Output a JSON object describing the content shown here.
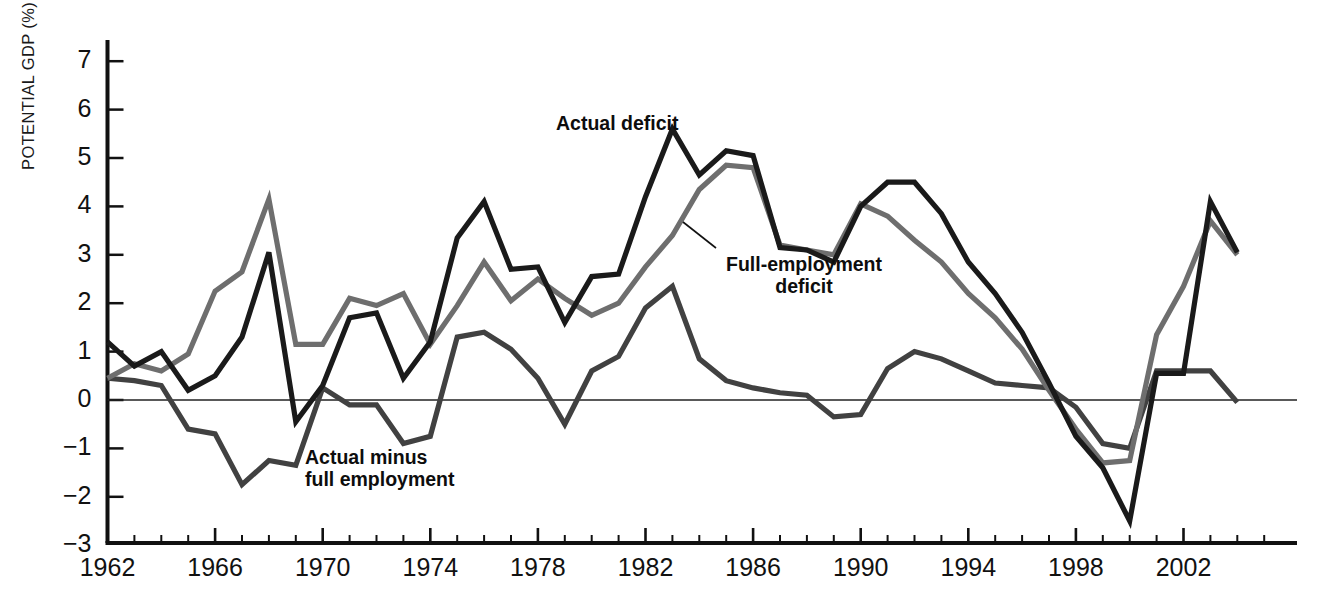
{
  "chart_data": {
    "type": "line",
    "title": "",
    "subtitle": "",
    "xlabel": "",
    "ylabel": "POTENTIAL GDP (%)",
    "xlim": [
      1962,
      2005
    ],
    "ylim": [
      -3,
      7
    ],
    "yticks": [
      7,
      6,
      5,
      4,
      3,
      2,
      1,
      0,
      -1,
      -2,
      -3
    ],
    "ytick_labels": [
      "7",
      "6",
      "5",
      "4",
      "3",
      "2",
      "1",
      "0",
      "−1",
      "−2",
      "−3"
    ],
    "xticks": [
      1962,
      1966,
      1970,
      1974,
      1978,
      1982,
      1986,
      1990,
      1994,
      1998,
      2002
    ],
    "xtick_labels": [
      "1962",
      "1966",
      "1970",
      "1974",
      "1978",
      "1982",
      "1986",
      "1990",
      "1994",
      "1998",
      "2002"
    ],
    "minor_xtick_step": 1,
    "grid": false,
    "zero_line": true,
    "legend_position": "inline-annotations",
    "x": [
      1962,
      1963,
      1964,
      1965,
      1966,
      1967,
      1968,
      1969,
      1970,
      1971,
      1972,
      1973,
      1974,
      1975,
      1976,
      1977,
      1978,
      1979,
      1980,
      1981,
      1982,
      1983,
      1984,
      1985,
      1986,
      1987,
      1988,
      1989,
      1990,
      1991,
      1992,
      1993,
      1994,
      1995,
      1996,
      1997,
      1998,
      1999,
      2000,
      2001,
      2002,
      2003,
      2004
    ],
    "series": [
      {
        "name": "Actual deficit",
        "color": "#1a1a1a",
        "values": [
          1.2,
          0.7,
          1.0,
          0.2,
          0.5,
          1.3,
          3.05,
          -0.45,
          0.3,
          1.7,
          1.8,
          0.45,
          1.2,
          3.35,
          4.1,
          2.7,
          2.75,
          1.6,
          2.55,
          2.6,
          4.2,
          5.6,
          4.65,
          5.15,
          5.05,
          3.15,
          3.1,
          2.85,
          4.0,
          4.5,
          4.5,
          3.85,
          2.85,
          2.2,
          1.4,
          0.35,
          -0.75,
          -1.4,
          -2.5,
          0.55,
          0.55,
          4.1,
          3.05
        ]
      },
      {
        "name": "Full-employment deficit",
        "color": "#6e6e6e",
        "values": [
          0.45,
          0.75,
          0.6,
          0.95,
          2.25,
          2.65,
          4.15,
          1.15,
          1.15,
          2.1,
          1.95,
          2.2,
          1.15,
          1.95,
          2.85,
          2.05,
          2.5,
          2.1,
          1.75,
          2.0,
          2.75,
          3.4,
          4.35,
          4.85,
          4.8,
          3.2,
          3.1,
          3.0,
          4.05,
          3.8,
          3.3,
          2.85,
          2.2,
          1.7,
          1.05,
          0.2,
          -0.6,
          -1.3,
          -1.25,
          1.35,
          2.35,
          3.7,
          3.0
        ]
      },
      {
        "name": "Actual minus full employment",
        "color": "#414141",
        "values": [
          0.45,
          0.4,
          0.3,
          -0.6,
          -0.7,
          -1.75,
          -1.25,
          -1.35,
          0.25,
          -0.1,
          -0.1,
          -0.9,
          -0.75,
          1.3,
          1.4,
          1.05,
          0.45,
          -0.5,
          0.6,
          0.9,
          1.9,
          2.35,
          0.85,
          0.4,
          0.25,
          0.15,
          0.1,
          -0.35,
          -0.3,
          0.65,
          1.0,
          0.85,
          0.6,
          0.35,
          0.3,
          0.25,
          -0.15,
          -0.9,
          -1.0,
          0.6,
          0.6,
          0.6,
          -0.05
        ]
      }
    ],
    "annotations": [
      {
        "name": "actual-deficit-label",
        "text": "Actual deficit",
        "x_px": 556,
        "y_px": 113,
        "align": "left",
        "leader": false
      },
      {
        "name": "full-employment-deficit-label",
        "text_line1": "Full-employment",
        "text_line2": "deficit",
        "x_px": 726,
        "y_px": 254,
        "align": "left",
        "leader": true,
        "leader_from_px": [
          716,
          248
        ],
        "leader_to_px": [
          683,
          222
        ]
      },
      {
        "name": "actual-minus-full-employment-label",
        "text_line1": "Actual minus",
        "text_line2": "full employment",
        "x_px": 305,
        "y_px": 447,
        "align": "left",
        "leader": false
      }
    ]
  },
  "axis": {
    "y_axis_name": "POTENTIAL GDP (%)",
    "x_axis_name": ""
  }
}
